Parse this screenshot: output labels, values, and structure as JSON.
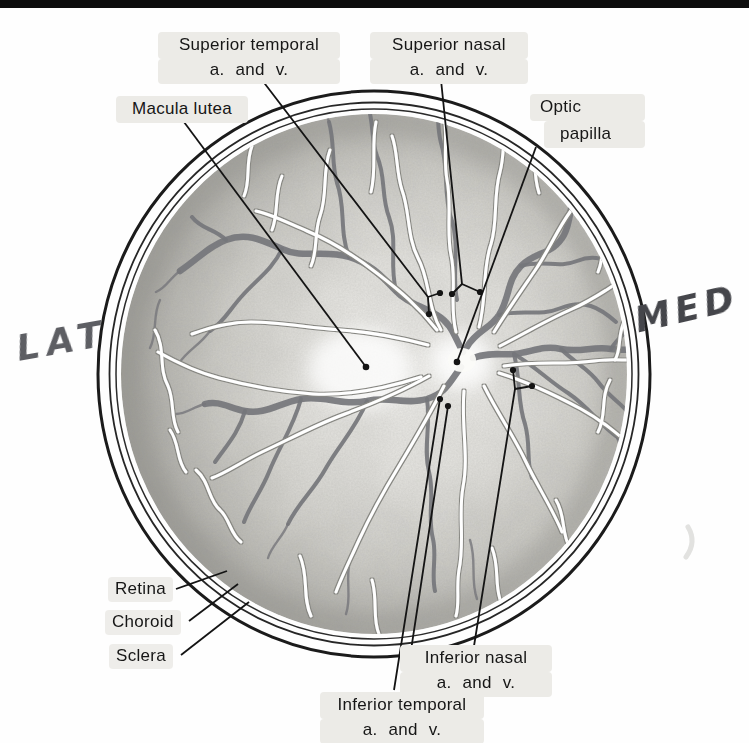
{
  "labels": {
    "superior_temporal": {
      "line1": "Superior temporal",
      "line2": "a. and v."
    },
    "superior_nasal": {
      "line1": "Superior nasal",
      "line2": "a. and v."
    },
    "macula_lutea": {
      "text": "Macula lutea"
    },
    "optic_papilla": {
      "line1": "Optic",
      "line2": "papilla"
    },
    "retina": {
      "text": "Retina"
    },
    "choroid": {
      "text": "Choroid"
    },
    "sclera": {
      "text": "Sclera"
    },
    "inferior_nasal": {
      "line1": "Inferior nasal",
      "line2": "a. and v."
    },
    "inferior_temporal": {
      "line1": "Inferior temporal",
      "line2": "a. and v."
    },
    "lateral_mark": {
      "text": "LAT"
    },
    "medial_mark": {
      "text": "MED"
    }
  },
  "colors": {
    "ink": "#141414",
    "vein_gray": "#75767b",
    "artery_white": "#ffffff",
    "label_highlight": "#ecebe7",
    "handwriting_lat": "#5d5e63",
    "handwriting_med": "#45464b",
    "top_bar": "#0d0d0d",
    "paper": "#ffffff"
  }
}
